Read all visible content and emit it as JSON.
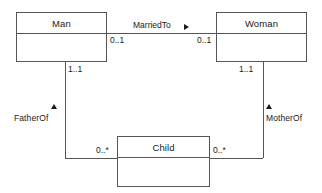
{
  "diagram": {
    "type": "uml-class-diagram",
    "classes": [
      {
        "id": "man",
        "name": "Man",
        "x": 16,
        "y": 12,
        "w": 91,
        "h": 50
      },
      {
        "id": "woman",
        "name": "Woman",
        "x": 216,
        "y": 12,
        "w": 91,
        "h": 50
      },
      {
        "id": "child",
        "name": "Child",
        "x": 117,
        "y": 136,
        "w": 93,
        "h": 51
      }
    ],
    "associations": [
      {
        "id": "marriedto",
        "name": "MarriedTo",
        "direction_marker": "right-triangle",
        "from": "Man",
        "to": "Woman",
        "from_multiplicity": "0..1",
        "to_multiplicity": "0..1"
      },
      {
        "id": "fatherof",
        "name": "FatherOf",
        "direction_marker": "up-triangle",
        "from": "Child",
        "to": "Man",
        "from_multiplicity": "0..*",
        "to_multiplicity": "1..1"
      },
      {
        "id": "motherof",
        "name": "MotherOf",
        "direction_marker": "up-triangle",
        "from": "Child",
        "to": "Woman",
        "from_multiplicity": "0..*",
        "to_multiplicity": "1..1"
      }
    ],
    "labels": {
      "married_to": "MarriedTo",
      "father_of": "FatherOf",
      "mother_of": "MotherOf",
      "mult_man_married": "0..1",
      "mult_woman_married": "0..1",
      "mult_man_father": "1..1",
      "mult_woman_mother": "1..1",
      "mult_child_father": "0..*",
      "mult_child_mother": "0..*"
    },
    "colors": {
      "stroke": "#555555",
      "text": "#1a1a1a",
      "background": "#ffffff"
    }
  }
}
